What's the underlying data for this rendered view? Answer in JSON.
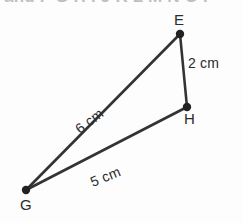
{
  "figure": {
    "title_fragment": "and F G H I J K L M N O P",
    "background_color": "#fdfdfd",
    "stroke_color": "#333333",
    "text_color": "#2b2b2b",
    "vertices": [
      {
        "name": "E",
        "label": "E",
        "x": 180,
        "y": 34
      },
      {
        "name": "H",
        "label": "H",
        "x": 187,
        "y": 107
      },
      {
        "name": "G",
        "label": "G",
        "x": 26,
        "y": 190
      }
    ],
    "edges": [
      {
        "name": "edge-EH",
        "from": "E",
        "to": "H",
        "measure": "2 cm"
      },
      {
        "name": "edge-GE",
        "from": "G",
        "to": "E",
        "measure": "6 cm"
      },
      {
        "name": "edge-GH",
        "from": "G",
        "to": "H",
        "measure": "5 cm"
      }
    ],
    "measure_labels": {
      "eh": "2 cm",
      "ge": "6 cm",
      "gh": "5 cm"
    },
    "vertex_labels": {
      "e": "E",
      "h": "H",
      "g": "G"
    }
  }
}
